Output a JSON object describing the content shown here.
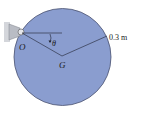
{
  "diagram": {
    "type": "physics-pendulum-disk",
    "colors": {
      "disk_fill": "#8a9dcf",
      "disk_edge": "#4a5270",
      "line": "#1e2230",
      "support": "#c8cbd2",
      "background": "#ffffff"
    },
    "labels": {
      "pivot": "O",
      "center": "G",
      "angle": "θ",
      "radius": "0.3 m"
    }
  }
}
